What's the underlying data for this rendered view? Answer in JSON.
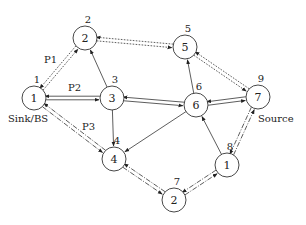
{
  "diagram": {
    "nodes": [
      {
        "key": "n1",
        "label": "1",
        "id_label": "1",
        "x": 34,
        "y": 98
      },
      {
        "key": "n2",
        "label": "2",
        "id_label": "2",
        "x": 85,
        "y": 38
      },
      {
        "key": "n3",
        "label": "3",
        "id_label": "3",
        "x": 112,
        "y": 98
      },
      {
        "key": "n4",
        "label": "4",
        "id_label": "4",
        "x": 114,
        "y": 159
      },
      {
        "key": "n5",
        "label": "5",
        "id_label": "5",
        "x": 185,
        "y": 47
      },
      {
        "key": "n6",
        "label": "6",
        "id_label": "6",
        "x": 196,
        "y": 105
      },
      {
        "key": "n7",
        "label": "7",
        "id_label": "9",
        "x": 258,
        "y": 97
      },
      {
        "key": "n8",
        "label": "1",
        "id_label": "8",
        "x": 227,
        "y": 165
      },
      {
        "key": "n9",
        "label": "2",
        "id_label": "7",
        "x": 174,
        "y": 200
      }
    ],
    "annotations": {
      "sink": "Sink/BS",
      "source": "Source",
      "path1": "P1",
      "path2": "P2",
      "path3": "P3"
    },
    "edges": [
      {
        "from": "n1",
        "to": "n2",
        "style": "dotted",
        "bidirectional": true,
        "path": "P1"
      },
      {
        "from": "n2",
        "to": "n5",
        "style": "dotted",
        "bidirectional": true,
        "path": "P1"
      },
      {
        "from": "n5",
        "to": "n7",
        "style": "dotted",
        "bidirectional": true,
        "path": "P1"
      },
      {
        "from": "n1",
        "to": "n3",
        "style": "solid",
        "bidirectional": true,
        "path": "P2"
      },
      {
        "from": "n3",
        "to": "n6",
        "style": "solid",
        "bidirectional": true,
        "path": "P2"
      },
      {
        "from": "n6",
        "to": "n7",
        "style": "solid",
        "bidirectional": true,
        "path": "P2"
      },
      {
        "from": "n1",
        "to": "n4",
        "style": "dashdot",
        "bidirectional": true,
        "path": "P3"
      },
      {
        "from": "n4",
        "to": "n9",
        "style": "dashdot",
        "bidirectional": true,
        "path": "P3"
      },
      {
        "from": "n9",
        "to": "n8",
        "style": "dashdot",
        "bidirectional": true,
        "path": "P3"
      },
      {
        "from": "n8",
        "to": "n7",
        "style": "dashdot",
        "bidirectional": true,
        "path": "P3"
      },
      {
        "from": "n3",
        "to": "n2",
        "style": "solid",
        "bidirectional": false
      },
      {
        "from": "n3",
        "to": "n4",
        "style": "solid",
        "bidirectional": false
      },
      {
        "from": "n6",
        "to": "n5",
        "style": "solid",
        "bidirectional": false
      },
      {
        "from": "n6",
        "to": "n4",
        "style": "solid",
        "bidirectional": false
      },
      {
        "from": "n8",
        "to": "n6",
        "style": "solid",
        "bidirectional": false
      }
    ]
  }
}
